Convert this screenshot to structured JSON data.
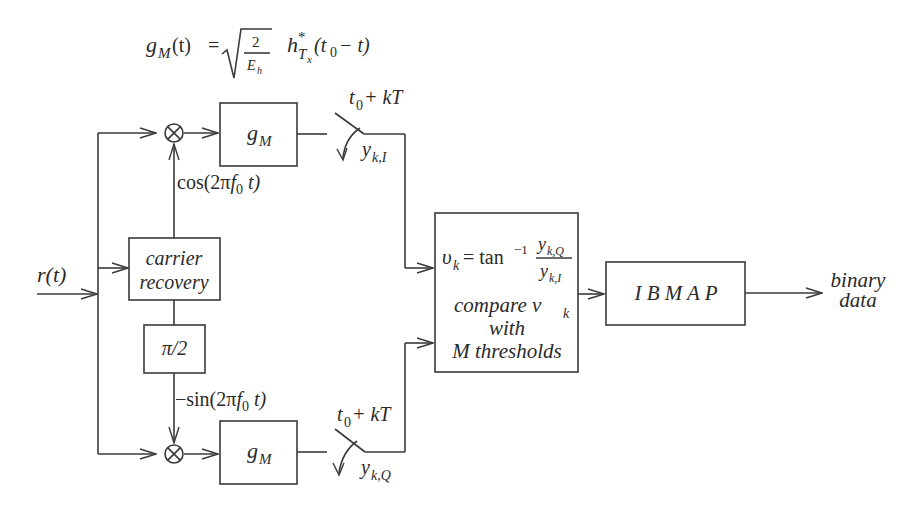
{
  "diagram": {
    "title_formula": {
      "lhs": "g",
      "lhs_sub": "M",
      "lhs_arg": "(t)",
      "equals": "=",
      "sqrt_num": "2",
      "sqrt_den": "E",
      "sqrt_den_sub": "h",
      "h": "h",
      "h_sup": "*",
      "h_sub": "T",
      "h_sub_sub": "x",
      "h_arg_open": "(t",
      "h_arg_sub": "0",
      "h_arg_close": "− t)"
    },
    "input": {
      "label": "r(t)"
    },
    "blocks": {
      "matched_filter_top": {
        "label": "g",
        "sub": "M"
      },
      "matched_filter_bottom": {
        "label": "g",
        "sub": "M"
      },
      "carrier_recovery": {
        "line1": "carrier",
        "line2": "recovery"
      },
      "phase_shift": {
        "label": "π/2"
      },
      "compare": {
        "eq_lhs": "υ",
        "eq_lhs_sub": "k",
        "eq_mid": "= tan",
        "eq_sup": "−1",
        "frac_num": "y",
        "frac_num_sub": "k,Q",
        "frac_den": "y",
        "frac_den_sub": "k,I",
        "line2": "compare v",
        "line2_sub": "k",
        "line3": "with",
        "line4": "M thresholds"
      },
      "ibmap": {
        "label": "I B M A P"
      }
    },
    "signals": {
      "cos": {
        "prefix": "cos(2π",
        "f": "f",
        "f_sub": "0",
        "suffix": " t)"
      },
      "sin": {
        "prefix": "−sin(2π",
        "f": "f",
        "f_sub": "0",
        "suffix": " t)"
      }
    },
    "samplers": {
      "top": {
        "time": "t",
        "time_sub": "0",
        "time_rest": " + kT",
        "out": "y",
        "out_sub": "k,I"
      },
      "bottom": {
        "time": "t",
        "time_sub": "0",
        "time_rest": " + kT",
        "out": "y",
        "out_sub": "k,Q"
      }
    },
    "output": {
      "line1": "binary",
      "line2": "data"
    }
  }
}
